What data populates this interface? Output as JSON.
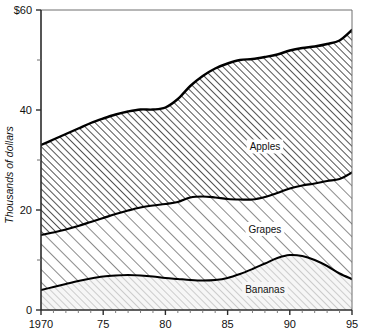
{
  "chart_data": {
    "type": "area",
    "title": "",
    "subtitle": "",
    "xlabel": "",
    "ylabel": "Thousands of dollars",
    "stacked": true,
    "grid": false,
    "legend_position": "inline-labels",
    "xlim": [
      1970,
      1995
    ],
    "ylim": [
      0,
      60
    ],
    "x_tick_labels": [
      "1970",
      "75",
      "80",
      "85",
      "90",
      "95"
    ],
    "x_tick_values": [
      1970,
      1975,
      1980,
      1985,
      1990,
      1995
    ],
    "x_minor_ticks": [
      1971,
      1972,
      1973,
      1974,
      1976,
      1977,
      1978,
      1979,
      1981,
      1982,
      1983,
      1984,
      1986,
      1987,
      1988,
      1989,
      1991,
      1992,
      1993,
      1994
    ],
    "y_tick_labels": [
      "0",
      "20",
      "40",
      "$60"
    ],
    "y_tick_values": [
      0,
      20,
      40,
      60
    ],
    "y_minor_ticks": [
      10,
      30,
      50
    ],
    "x": [
      1970,
      1971,
      1972,
      1973,
      1974,
      1975,
      1976,
      1977,
      1978,
      1979,
      1980,
      1981,
      1982,
      1983,
      1984,
      1985,
      1986,
      1987,
      1988,
      1989,
      1990,
      1991,
      1992,
      1993,
      1994,
      1995
    ],
    "series": [
      {
        "name": "Bananas",
        "label": "Bananas",
        "fill": "#f2f2f2",
        "hatch": "light-diagonal",
        "values": [
          4.0,
          4.6,
          5.2,
          5.8,
          6.3,
          6.7,
          6.9,
          7.0,
          6.9,
          6.7,
          6.4,
          6.2,
          6.0,
          5.9,
          6.0,
          6.4,
          7.2,
          8.2,
          9.3,
          10.4,
          11.0,
          10.8,
          10.0,
          8.8,
          7.3,
          6.2
        ]
      },
      {
        "name": "Grapes",
        "label": "Grapes",
        "fill": "#ffffff",
        "hatch": "medium-diagonal",
        "values": [
          11.0,
          10.9,
          10.9,
          11.0,
          11.3,
          11.7,
          12.3,
          12.9,
          13.6,
          14.2,
          14.8,
          15.4,
          16.5,
          16.8,
          16.5,
          15.8,
          14.9,
          13.9,
          13.3,
          13.0,
          13.3,
          14.1,
          15.3,
          17.0,
          18.9,
          21.3
        ]
      },
      {
        "name": "Apples",
        "label": "Apples",
        "fill": "#e9e9e9",
        "hatch": "dense-diagonal",
        "values": [
          18.0,
          18.6,
          19.1,
          19.5,
          19.8,
          19.9,
          19.9,
          19.8,
          19.6,
          19.2,
          19.3,
          20.6,
          22.3,
          24.1,
          25.8,
          27.1,
          27.9,
          28.1,
          28.0,
          27.7,
          27.6,
          27.5,
          27.4,
          27.4,
          27.7,
          28.5
        ]
      }
    ],
    "cumulative_top_of_band": {
      "Bananas": [
        4.0,
        4.6,
        5.2,
        5.8,
        6.3,
        6.7,
        6.9,
        7.0,
        6.9,
        6.7,
        6.4,
        6.2,
        6.0,
        5.9,
        6.0,
        6.4,
        7.2,
        8.2,
        9.3,
        10.4,
        11.0,
        10.8,
        10.0,
        8.8,
        7.3,
        6.2
      ],
      "Grapes": [
        15.0,
        15.5,
        16.1,
        16.8,
        17.6,
        18.4,
        19.2,
        19.9,
        20.5,
        20.9,
        21.2,
        21.6,
        22.5,
        22.7,
        22.5,
        22.2,
        22.1,
        22.1,
        22.6,
        23.4,
        24.3,
        24.9,
        25.3,
        25.8,
        26.2,
        27.5
      ],
      "Apples": [
        33.0,
        34.1,
        35.2,
        36.3,
        37.4,
        38.3,
        39.1,
        39.7,
        40.1,
        40.1,
        40.5,
        42.2,
        44.8,
        46.8,
        48.3,
        49.3,
        50.0,
        50.2,
        50.6,
        51.1,
        51.9,
        52.4,
        52.7,
        53.2,
        53.9,
        56.0
      ]
    },
    "annotations": [
      {
        "text": "Apples",
        "x": 1988,
        "y": 32.0
      },
      {
        "text": "Grapes",
        "x": 1988,
        "y": 15.5
      },
      {
        "text": "Bananas",
        "x": 1988,
        "y": 3.5
      }
    ]
  },
  "axes": {
    "y_title": "Thousands of dollars",
    "y_ticks": [
      {
        "label": "$60",
        "value": 60
      },
      {
        "label": "40",
        "value": 40
      },
      {
        "label": "20",
        "value": 20
      },
      {
        "label": "0",
        "value": 0
      }
    ],
    "x_ticks": [
      {
        "label": "1970",
        "value": 1970
      },
      {
        "label": "75",
        "value": 1975
      },
      {
        "label": "80",
        "value": 1980
      },
      {
        "label": "85",
        "value": 1985
      },
      {
        "label": "90",
        "value": 1990
      },
      {
        "label": "95",
        "value": 1995
      }
    ]
  },
  "series_labels": {
    "apples": "Apples",
    "grapes": "Grapes",
    "bananas": "Bananas"
  },
  "colors": {
    "line": "#000000",
    "axis": "#4a4a4a",
    "text": "#111111",
    "apples_fill": "#e9e9e9",
    "grapes_fill": "#ffffff",
    "bananas_fill": "#f2f2f2"
  }
}
